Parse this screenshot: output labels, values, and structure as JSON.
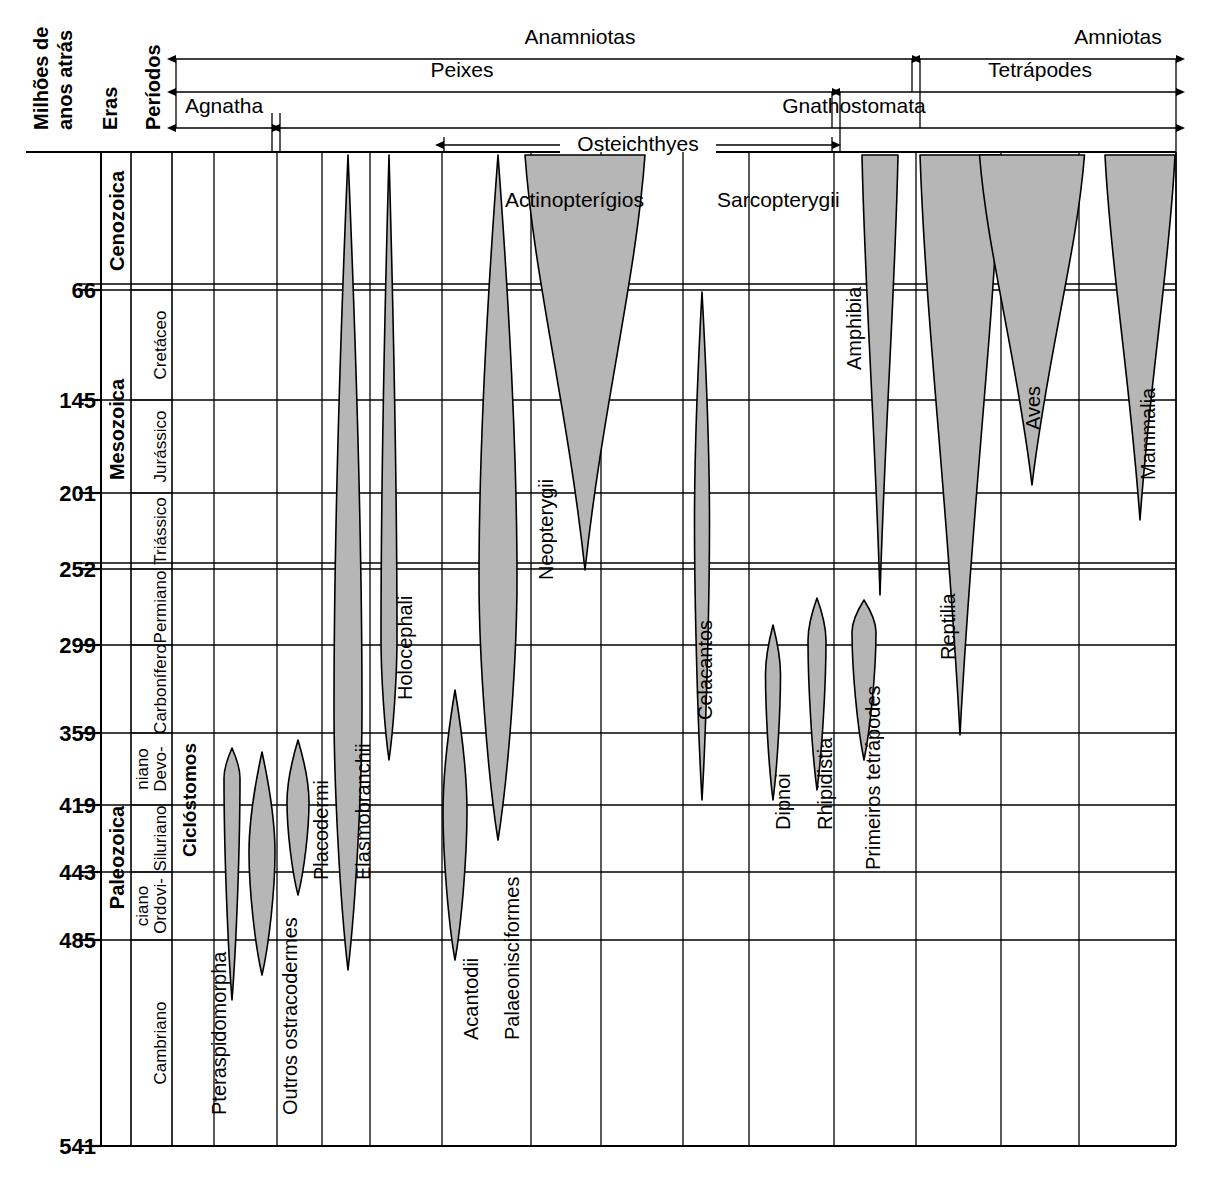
{
  "axis": {
    "title_line1": "Milhões de",
    "title_line2": "anos atrás",
    "eras_header": "Eras",
    "periods_header": "Períodos",
    "ticks": [
      {
        "label": "66",
        "value": 66,
        "y": 290
      },
      {
        "label": "145",
        "value": 145,
        "y": 400
      },
      {
        "label": "201",
        "value": 201,
        "y": 493
      },
      {
        "label": "252",
        "value": 252,
        "y": 569
      },
      {
        "label": "299",
        "value": 299,
        "y": 645
      },
      {
        "label": "359",
        "value": 359,
        "y": 733
      },
      {
        "label": "419",
        "value": 419,
        "y": 805
      },
      {
        "label": "443",
        "value": 443,
        "y": 872
      },
      {
        "label": "485",
        "value": 485,
        "y": 940
      },
      {
        "label": "541",
        "value": 541,
        "y": 1146
      }
    ]
  },
  "eras": [
    {
      "label": "Cenozoica",
      "from": 0,
      "to": 66
    },
    {
      "label": "Mesozoica",
      "from": 66,
      "to": 252
    },
    {
      "label": "Paleozoica",
      "from": 252,
      "to": 541
    }
  ],
  "periods": [
    {
      "label": "Cretáceo",
      "from": 66,
      "to": 145
    },
    {
      "label": "Jurássico",
      "from": 145,
      "to": 201
    },
    {
      "label": "Triássico",
      "from": 201,
      "to": 252
    },
    {
      "label": "Permiano",
      "from": 252,
      "to": 299
    },
    {
      "label": "Carbonífero",
      "from": 299,
      "to": 359
    },
    {
      "label": "Devo-\nniano",
      "from": 359,
      "to": 419
    },
    {
      "label": "Siluriano",
      "from": 419,
      "to": 443
    },
    {
      "label": "Ordovi-\nciano",
      "from": 443,
      "to": 485
    },
    {
      "label": "Cambriano",
      "from": 485,
      "to": 541
    }
  ],
  "brackets": [
    {
      "name": "anamniotas",
      "label": "Anamniotas",
      "x1": 176,
      "x2": 912,
      "y": 59,
      "label_x": 580,
      "label_y": 44,
      "arrow_left": true,
      "arrow_right": true
    },
    {
      "name": "amniotas",
      "label": "Amniotas",
      "x1": 920,
      "x2": 1176,
      "y": 59,
      "label_x": 1118,
      "label_y": 44,
      "arrow_left": true,
      "arrow_right": true
    },
    {
      "name": "peixes",
      "label": "Peixes",
      "x1": 176,
      "x2": 832,
      "y": 92,
      "label_x": 462,
      "label_y": 77,
      "arrow_left": true,
      "arrow_right": true
    },
    {
      "name": "tetrapodes",
      "label": "Tetrápodes",
      "x1": 840,
      "x2": 1176,
      "y": 92,
      "label_x": 1040,
      "label_y": 77,
      "arrow_left": true,
      "arrow_right": true
    },
    {
      "name": "agnatha",
      "label": "Agnatha",
      "x1": 176,
      "x2": 272,
      "y": 128,
      "label_x": 224,
      "label_y": 113,
      "arrow_left": true,
      "arrow_right": true
    },
    {
      "name": "gnathostomata",
      "label": "Gnathostomata",
      "x1": 280,
      "x2": 1176,
      "y": 128,
      "label_x": 854,
      "label_y": 113,
      "arrow_left": true,
      "arrow_right": true
    },
    {
      "name": "osteichthyes",
      "label": "Osteichthyes",
      "x1": 444,
      "x2": 832,
      "y": 145,
      "label_x": 638,
      "label_y": 145,
      "arrow_left": true,
      "arrow_right": true,
      "inline": true
    }
  ],
  "group_labels": [
    {
      "name": "ciclostomos",
      "label": "Ciclóstomos",
      "x": 196,
      "y": 800,
      "size": 19,
      "weight": "bold"
    },
    {
      "name": "actinopterigios",
      "label": "Actinopterígios",
      "x": 505,
      "y": 207,
      "size": 21,
      "weight": "normal",
      "horizontal": true
    },
    {
      "name": "sarcopterygii",
      "label": "Sarcopterygii",
      "x": 717,
      "y": 207,
      "size": 21,
      "weight": "normal",
      "horizontal": true
    }
  ],
  "taxa": [
    {
      "name": "pteraspidomorpha",
      "label": "Pteraspidomorpha",
      "label_x": 226,
      "label_y": 1115,
      "cx": 232,
      "top": 748,
      "bottom": 1000,
      "max_w": 16,
      "peak": 0.12
    },
    {
      "name": "outros-ostracodermes",
      "label": "Outros ostracodermes",
      "label_x": 297,
      "label_y": 1115,
      "cx": 262,
      "top": 752,
      "bottom": 975,
      "max_w": 26,
      "peak": 0.45
    },
    {
      "name": "placodermi",
      "label": "Placodermi",
      "label_x": 328,
      "label_y": 880,
      "cx": 298,
      "top": 740,
      "bottom": 895,
      "max_w": 22,
      "peak": 0.4
    },
    {
      "name": "elasmobranchii",
      "label": "Elasmobranchii",
      "label_x": 370,
      "label_y": 880,
      "cx": 348,
      "top": 155,
      "bottom": 970,
      "max_w": 28,
      "peak": 0.68
    },
    {
      "name": "holocephali",
      "label": "Holocephali",
      "label_x": 412,
      "label_y": 700,
      "cx": 389,
      "top": 155,
      "bottom": 760,
      "max_w": 16,
      "peak": 0.8
    },
    {
      "name": "acantodii",
      "label": "Acantodii",
      "label_x": 478,
      "label_y": 1040,
      "cx": 455,
      "top": 690,
      "bottom": 960,
      "max_w": 24,
      "peak": 0.45
    },
    {
      "name": "palaeonisciformes",
      "label": "Palaeonisciformes",
      "label_x": 519,
      "label_y": 1040,
      "cx": 498,
      "top": 155,
      "bottom": 840,
      "max_w": 38,
      "peak": 0.62
    },
    {
      "name": "neopterygii",
      "label": "Neopterygii",
      "label_x": 553,
      "label_y": 580,
      "cx": 585,
      "top": 155,
      "bottom": 570,
      "max_w": 120,
      "peak": 0.0
    },
    {
      "name": "celacantos",
      "label": "Celacantos",
      "label_x": 712,
      "label_y": 720,
      "cx": 702,
      "top": 292,
      "bottom": 800,
      "max_w": 15,
      "peak": 0.45
    },
    {
      "name": "dipnoi",
      "label": "Dipnoi",
      "label_x": 790,
      "label_y": 830,
      "cx": 773,
      "top": 625,
      "bottom": 800,
      "max_w": 15,
      "peak": 0.28
    },
    {
      "name": "rhipidistia",
      "label": "Rhipidistia",
      "label_x": 832,
      "label_y": 830,
      "cx": 817,
      "top": 598,
      "bottom": 790,
      "max_w": 18,
      "peak": 0.22
    },
    {
      "name": "primeiros-tetrapodes",
      "label": "Primeiros tetrápodes",
      "label_x": 880,
      "label_y": 870,
      "cx": 864,
      "top": 600,
      "bottom": 760,
      "max_w": 24,
      "peak": 0.2
    },
    {
      "name": "amphibia",
      "label": "Amphibia",
      "label_x": 861,
      "label_y": 370,
      "cx": 880,
      "top": 155,
      "bottom": 595,
      "max_w": 36,
      "peak": 0.0
    },
    {
      "name": "reptilia",
      "label": "Reptilia",
      "label_x": 955,
      "label_y": 660,
      "cx": 960,
      "top": 155,
      "bottom": 735,
      "max_w": 80,
      "peak": 0.0
    },
    {
      "name": "aves",
      "label": "Aves",
      "label_x": 1040,
      "label_y": 430,
      "cx": 1032,
      "top": 155,
      "bottom": 485,
      "max_w": 105,
      "peak": 0.0
    },
    {
      "name": "mammalia",
      "label": "Mammalia",
      "label_x": 1155,
      "label_y": 480,
      "cx": 1140,
      "top": 155,
      "bottom": 520,
      "max_w": 70,
      "peak": 0.0
    }
  ],
  "colors": {
    "fill": "#b6b6b6",
    "stroke": "#000000",
    "grid": "#000000",
    "background": "#ffffff"
  }
}
